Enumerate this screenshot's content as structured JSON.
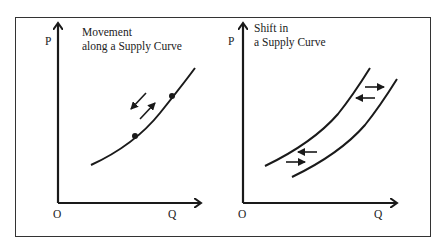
{
  "panels": [
    {
      "title_line1": "Movement",
      "title_line2": "along a Supply Curve",
      "y_axis_label": "P",
      "x_axis_label": "Q",
      "origin_label": "O"
    },
    {
      "title_line1": "Shift in",
      "title_line2": "a Supply Curve",
      "y_axis_label": "P",
      "x_axis_label": "Q",
      "origin_label": "O"
    }
  ],
  "colors": {
    "ink": "#1a1a1a",
    "frame": "#333333",
    "background": "#ffffff"
  }
}
